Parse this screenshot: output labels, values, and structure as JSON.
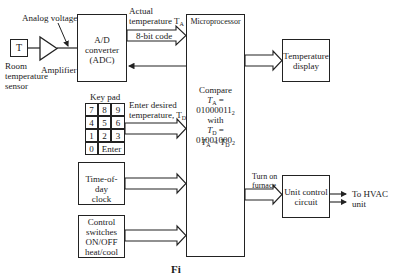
{
  "diagram": {
    "type": "block-diagram"
  },
  "sensor": {
    "symbol": "T",
    "label_lines": [
      "Room",
      "temperature",
      "sensor"
    ]
  },
  "amplifier": {
    "label": "Amplifier"
  },
  "analog_voltage_label": "Analog voltage",
  "adc": {
    "lines": [
      "A/D",
      "converter",
      "(ADC)"
    ]
  },
  "adc_output": {
    "label_line1": "Actual",
    "label_line2": "temperature T",
    "label_sub": "A",
    "bus_label": "8-bit code"
  },
  "microprocessor": {
    "title": "Microprocessor",
    "compare_label": "Compare",
    "ta_prefix": "T",
    "ta_sub": "A",
    "ta_value": " = 01000011",
    "ta_base": "2",
    "with_label": "with",
    "td_prefix": "T",
    "td_sub": "D",
    "td_value": " = 01001000",
    "td_base": "2",
    "result_a": "T",
    "result_a_sub": "A",
    "result_op": " < ",
    "result_d": "T",
    "result_d_sub": "D"
  },
  "temperature_display": {
    "lines": [
      "Temperature",
      "display"
    ]
  },
  "keypad": {
    "title": "Key pad",
    "rows": [
      [
        "7",
        "8",
        "9"
      ],
      [
        "4",
        "5",
        "6"
      ],
      [
        "1",
        "2",
        "3"
      ]
    ],
    "zero": "0",
    "enter": "Enter",
    "arrow_label_line1": "Enter desired",
    "arrow_label_line2": "temperature, T",
    "arrow_label_sub": "D"
  },
  "clock": {
    "lines": [
      "Time-of-day",
      "clock"
    ]
  },
  "control_switches": {
    "lines": [
      "Control",
      "switches",
      "ON/OFF",
      "heat/cool"
    ]
  },
  "furnace_label": {
    "line1": "Turn on",
    "line2": "furnace"
  },
  "unit_control": {
    "lines": [
      "Unit control",
      "circuit"
    ]
  },
  "hvac_output": {
    "line1": "To HVAC",
    "line2": "unit"
  },
  "caption_partial": "Fi"
}
